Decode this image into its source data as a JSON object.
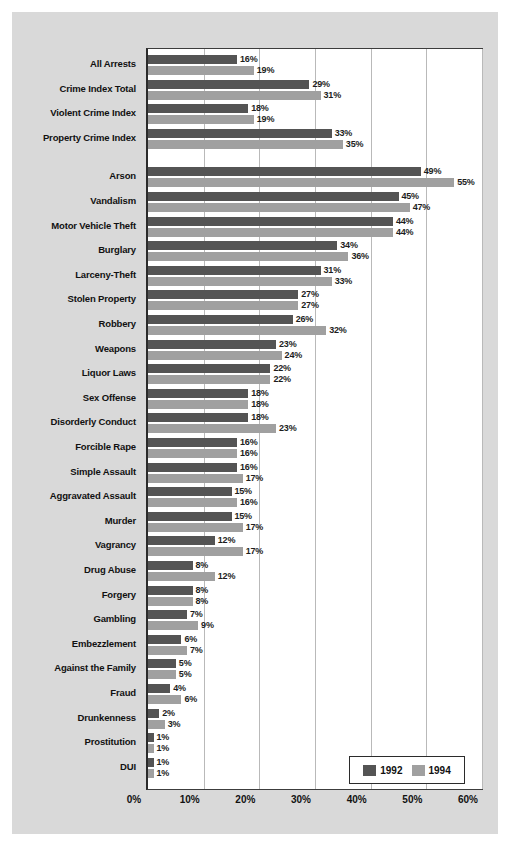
{
  "chart_data": {
    "type": "bar",
    "orientation": "horizontal",
    "title": "",
    "xlabel": "",
    "ylabel": "",
    "xlim": [
      0,
      60
    ],
    "xticks": [
      "0%",
      "10%",
      "20%",
      "30%",
      "40%",
      "50%",
      "60%"
    ],
    "xtick_values": [
      0,
      10,
      20,
      30,
      40,
      50,
      60
    ],
    "grid": "vertical",
    "legend_position": "bottom-right",
    "value_suffix": "%",
    "series": [
      {
        "name": "1992",
        "color": "#545454",
        "values": [
          16,
          29,
          18,
          33,
          49,
          45,
          44,
          34,
          31,
          27,
          26,
          23,
          22,
          18,
          18,
          16,
          16,
          15,
          15,
          12,
          8,
          8,
          7,
          6,
          5,
          4,
          2,
          1,
          1
        ],
        "labels": [
          "16%",
          "29%",
          "18%",
          "33%",
          "49%",
          "45%",
          "44%",
          "34%",
          "31%",
          "27%",
          "26%",
          "23%",
          "22%",
          "18%",
          "18%",
          "16%",
          "16%",
          "15%",
          "15%",
          "12%",
          "8%",
          "8%",
          "7%",
          "6%",
          "5%",
          "4%",
          "2%",
          "1%",
          "1%"
        ]
      },
      {
        "name": "1994",
        "color": "#a0a0a0",
        "values": [
          19,
          31,
          19,
          35,
          55,
          47,
          44,
          36,
          33,
          27,
          32,
          24,
          22,
          18,
          23,
          16,
          17,
          16,
          17,
          17,
          12,
          8,
          9,
          7,
          5,
          6,
          3,
          1,
          1
        ],
        "labels": [
          "19%",
          "31%",
          "19%",
          "35%",
          "55%",
          "47%",
          "44%",
          "36%",
          "33%",
          "27%",
          "32%",
          "24%",
          "22%",
          "18%",
          "23%",
          "16%",
          "17%",
          "16%",
          "17%",
          "17%",
          "12%",
          "8%",
          "9%",
          "7%",
          "5%",
          "6%",
          "3%",
          "1%",
          "1%"
        ]
      }
    ],
    "categories": [
      "All Arrests",
      "Crime Index Total",
      "Violent Crime Index",
      "Property Crime Index",
      "Arson",
      "Vandalism",
      "Motor Vehicle Theft",
      "Burglary",
      "Larceny-Theft",
      "Stolen Property",
      "Robbery",
      "Weapons",
      "Liquor Laws",
      "Sex Offense",
      "Disorderly Conduct",
      "Forcible Rape",
      "Simple Assault",
      "Aggravated Assault",
      "Murder",
      "Vagrancy",
      "Drug Abuse",
      "Forgery",
      "Gambling",
      "Embezzlement",
      "Against the Family",
      "Fraud",
      "Drunkenness",
      "Prostitution",
      "DUI"
    ],
    "group_gap_after_index": 3
  },
  "legend": {
    "items": [
      {
        "label": "1992",
        "color": "#545454"
      },
      {
        "label": "1994",
        "color": "#a0a0a0"
      }
    ]
  },
  "colors": {
    "panel_background": "#d9d9d9",
    "plot_background": "#ffffff",
    "axis": "#2b2b2b",
    "gridline": "#b9b9b9",
    "series_1992": "#545454",
    "series_1994": "#a0a0a0",
    "text": "#111111"
  }
}
